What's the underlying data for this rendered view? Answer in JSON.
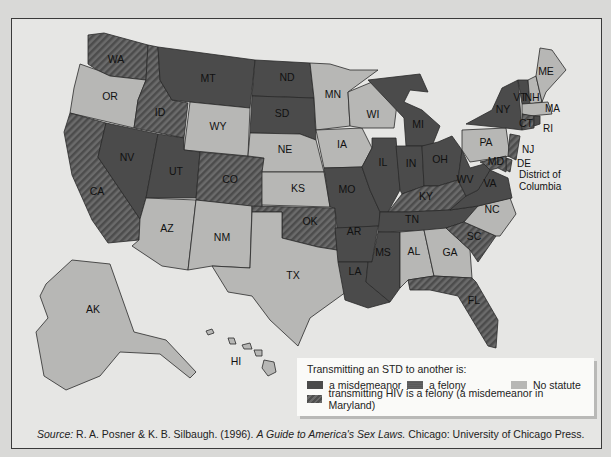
{
  "figure": {
    "type": "choropleth map of United States",
    "legend": {
      "title": "Transmitting an STD to another is:",
      "items": [
        {
          "key": "misdemeanor",
          "label": "a misdemeanor",
          "color": "#4b4b4b",
          "pattern": "solid"
        },
        {
          "key": "felony",
          "label": "a felony",
          "color": "#5e5e5e",
          "pattern": "solid"
        },
        {
          "key": "none",
          "label": "No statute",
          "color": "#b7b7b5",
          "pattern": "solid"
        },
        {
          "key": "hiv",
          "label": "transmitting HIV is a felony (a misdemeanor in Maryland)",
          "color": "#4e4e4e",
          "pattern": "hatched"
        }
      ]
    },
    "source": {
      "prefix": "Source:",
      "authors": "R. A. Posner & K. B. Silbaugh. (1996).",
      "title": "A Guide to America's Sex Laws.",
      "publisher": "Chicago: University of Chicago Press."
    },
    "annotations": {
      "dc_line1": "District of",
      "dc_line2": "Columbia"
    },
    "states": {
      "WA": {
        "label": "WA",
        "category": "hiv"
      },
      "OR": {
        "label": "OR",
        "category": "none"
      },
      "CA": {
        "label": "CA",
        "category": "hiv"
      },
      "ID": {
        "label": "ID",
        "category": "hiv"
      },
      "NV": {
        "label": "NV",
        "category": "misdemeanor"
      },
      "MT": {
        "label": "MT",
        "category": "misdemeanor"
      },
      "WY": {
        "label": "WY",
        "category": "none"
      },
      "UT": {
        "label": "UT",
        "category": "misdemeanor"
      },
      "CO": {
        "label": "CO",
        "category": "hiv"
      },
      "AZ": {
        "label": "AZ",
        "category": "none"
      },
      "NM": {
        "label": "NM",
        "category": "none"
      },
      "ND": {
        "label": "ND",
        "category": "misdemeanor"
      },
      "SD": {
        "label": "SD",
        "category": "misdemeanor"
      },
      "NE": {
        "label": "NE",
        "category": "none"
      },
      "KS": {
        "label": "KS",
        "category": "none"
      },
      "OK": {
        "label": "OK",
        "category": "hiv"
      },
      "TX": {
        "label": "TX",
        "category": "none"
      },
      "MN": {
        "label": "MN",
        "category": "none"
      },
      "IA": {
        "label": "IA",
        "category": "none"
      },
      "MO": {
        "label": "MO",
        "category": "misdemeanor"
      },
      "AR": {
        "label": "AR",
        "category": "misdemeanor"
      },
      "LA": {
        "label": "LA",
        "category": "misdemeanor"
      },
      "WI": {
        "label": "WI",
        "category": "none"
      },
      "IL": {
        "label": "IL",
        "category": "misdemeanor"
      },
      "MI": {
        "label": "MI",
        "category": "misdemeanor"
      },
      "IN": {
        "label": "IN",
        "category": "misdemeanor"
      },
      "OH": {
        "label": "OH",
        "category": "misdemeanor"
      },
      "KY": {
        "label": "KY",
        "category": "hiv"
      },
      "TN": {
        "label": "TN",
        "category": "misdemeanor"
      },
      "MS": {
        "label": "MS",
        "category": "misdemeanor"
      },
      "AL": {
        "label": "AL",
        "category": "none"
      },
      "GA": {
        "label": "GA",
        "category": "none"
      },
      "FL": {
        "label": "FL",
        "category": "hiv"
      },
      "SC": {
        "label": "SC",
        "category": "hiv"
      },
      "NC": {
        "label": "NC",
        "category": "none"
      },
      "VA": {
        "label": "VA",
        "category": "misdemeanor"
      },
      "WV": {
        "label": "WV",
        "category": "misdemeanor"
      },
      "PA": {
        "label": "PA",
        "category": "none"
      },
      "NY": {
        "label": "NY",
        "category": "misdemeanor"
      },
      "VT": {
        "label": "VT",
        "category": "misdemeanor"
      },
      "NH": {
        "label": "NH",
        "category": "none"
      },
      "ME": {
        "label": "ME",
        "category": "none"
      },
      "MA": {
        "label": "MA",
        "category": "none"
      },
      "RI": {
        "label": "RI",
        "category": "misdemeanor"
      },
      "CT": {
        "label": "CT",
        "category": "hiv"
      },
      "NJ": {
        "label": "NJ",
        "category": "hiv"
      },
      "DE": {
        "label": "DE",
        "category": "hiv"
      },
      "MD": {
        "label": "MD",
        "category": "hiv"
      },
      "AK": {
        "label": "AK",
        "category": "none"
      },
      "HI": {
        "label": "HI",
        "category": "none"
      }
    }
  }
}
